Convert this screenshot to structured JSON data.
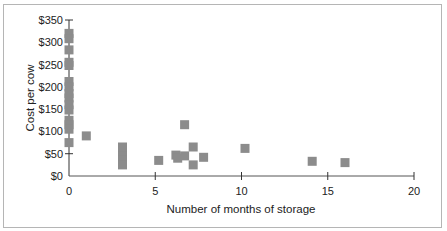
{
  "chart_data": {
    "type": "scatter",
    "title": "",
    "xlabel": "Number of months of storage",
    "ylabel": "Cost per cow",
    "xlim": [
      0,
      20
    ],
    "ylim": [
      0,
      350
    ],
    "x_ticks": [
      0,
      5,
      10,
      15,
      20
    ],
    "x_tick_labels": [
      "0",
      "5",
      "10",
      "15",
      "20"
    ],
    "y_ticks": [
      0,
      50,
      100,
      150,
      200,
      250,
      300,
      350
    ],
    "y_tick_labels": [
      "$0",
      "$50",
      "$100",
      "$150",
      "$200",
      "$250",
      "$300",
      "$350"
    ],
    "grid": false,
    "legend": null,
    "marker": "square",
    "marker_color": "#8c8c8c",
    "series": [
      {
        "name": "Cost per cow",
        "points": [
          {
            "x": 0,
            "y": 320
          },
          {
            "x": 0,
            "y": 308
          },
          {
            "x": 0,
            "y": 283
          },
          {
            "x": 0,
            "y": 255
          },
          {
            "x": 0,
            "y": 248
          },
          {
            "x": 0,
            "y": 212
          },
          {
            "x": 0,
            "y": 200
          },
          {
            "x": 0,
            "y": 185
          },
          {
            "x": 0,
            "y": 175
          },
          {
            "x": 0,
            "y": 160
          },
          {
            "x": 0,
            "y": 148
          },
          {
            "x": 0,
            "y": 125
          },
          {
            "x": 0,
            "y": 115
          },
          {
            "x": 0,
            "y": 105
          },
          {
            "x": 0,
            "y": 75
          },
          {
            "x": 1,
            "y": 90
          },
          {
            "x": 3.1,
            "y": 65
          },
          {
            "x": 3.1,
            "y": 55
          },
          {
            "x": 3.1,
            "y": 45
          },
          {
            "x": 3.1,
            "y": 35
          },
          {
            "x": 3.1,
            "y": 25
          },
          {
            "x": 5.2,
            "y": 35
          },
          {
            "x": 6.2,
            "y": 47
          },
          {
            "x": 6.3,
            "y": 40
          },
          {
            "x": 6.7,
            "y": 45
          },
          {
            "x": 6.7,
            "y": 115
          },
          {
            "x": 7.2,
            "y": 65
          },
          {
            "x": 7.2,
            "y": 25
          },
          {
            "x": 7.8,
            "y": 42
          },
          {
            "x": 10.2,
            "y": 62
          },
          {
            "x": 14.1,
            "y": 33
          },
          {
            "x": 16,
            "y": 30
          }
        ]
      }
    ]
  }
}
